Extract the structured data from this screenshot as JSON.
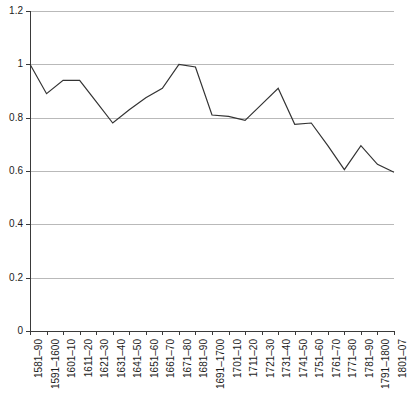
{
  "chart_data": {
    "type": "line",
    "title": "",
    "subtitle": "",
    "xlabel": "",
    "ylabel": "",
    "categories": [
      "1581–90",
      "1591–1600",
      "1601–10",
      "1611–20",
      "1621–30",
      "1631–40",
      "1641–50",
      "1651–60",
      "1661–70",
      "1671–80",
      "1681–90",
      "1691–1700",
      "1701–10",
      "1711–20",
      "1721–30",
      "1731–40",
      "1741–50",
      "1751–60",
      "1761–70",
      "1771–80",
      "1781–90",
      "1791–1800",
      "1801–07"
    ],
    "values": [
      1.0,
      0.89,
      0.94,
      0.94,
      0.86,
      0.78,
      0.83,
      0.875,
      0.91,
      1.0,
      0.99,
      0.81,
      0.805,
      0.79,
      0.85,
      0.91,
      0.775,
      0.78,
      0.695,
      0.605,
      0.695,
      0.625,
      0.595
    ],
    "series": [
      {
        "name": "",
        "values": [
          1.0,
          0.89,
          0.94,
          0.94,
          0.86,
          0.78,
          0.83,
          0.875,
          0.91,
          1.0,
          0.99,
          0.81,
          0.805,
          0.79,
          0.85,
          0.91,
          0.775,
          0.78,
          0.695,
          0.605,
          0.695,
          0.625,
          0.595
        ]
      }
    ],
    "ylim": [
      0,
      1.2
    ],
    "y_ticks": [
      0,
      0.2,
      0.4,
      0.6,
      0.8,
      1,
      1.2
    ],
    "y_tick_labels": [
      "0",
      "0.2",
      "0.4",
      "0.6",
      "0.8",
      "1",
      "1.2"
    ],
    "grid": true,
    "grid_axis": "y",
    "legend": false,
    "legend_position": "none",
    "line_color": "#333333",
    "grid_color": "#b9b9b9",
    "axis_color": "#3a3a3a",
    "markers": false,
    "x_tick_label_rotation": -90
  }
}
